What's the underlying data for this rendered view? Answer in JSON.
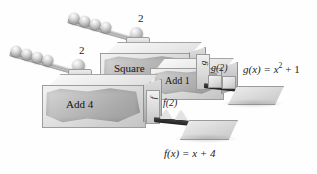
{
  "figure": {
    "background_color": "#ffffff",
    "ink_color": "#1c1c1c"
  },
  "machines": [
    {
      "id": "g-machine",
      "input_label": "2",
      "stage_labels": [
        "Square",
        "Add 1"
      ],
      "output_label": "g(2)",
      "panel_letter": "g",
      "formula": "g(x) = x",
      "formula_exponent": "2",
      "formula_tail": "+ 1",
      "formula_full": "g(x) = x² + 1",
      "input_balls": 5
    },
    {
      "id": "f-machine",
      "input_label": "2",
      "stage_labels": [
        "Add 4"
      ],
      "output_label": "f(2)",
      "panel_letter": "f",
      "formula": "f(x) = x + 4",
      "formula_full": "f(x) = x + 4",
      "input_balls": 5
    }
  ],
  "labels": {
    "square": "Square",
    "add_one": "Add 1",
    "add_four": "Add 4",
    "two_top": "2",
    "two_bottom": "2",
    "g_of_two": "g(2)",
    "f_of_two": "f(2)",
    "g_panel": "g",
    "f_panel": "f",
    "g_formula_head": "g(x) = x",
    "g_formula_exp": "2",
    "g_formula_tail": "+ 1",
    "f_formula": "f(x) = x + 4"
  }
}
